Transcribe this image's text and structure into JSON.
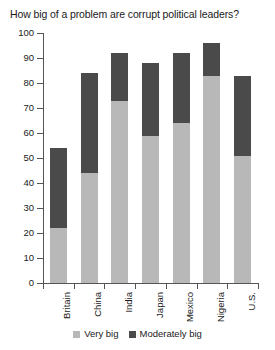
{
  "chart_data": {
    "type": "bar",
    "subtype": "stacked-bar",
    "title": "How big of a problem are corrupt political leaders?",
    "xlabel": "",
    "ylabel": "",
    "ylim": [
      0,
      100
    ],
    "ytick_step": 10,
    "yticks": [
      100,
      90,
      80,
      70,
      60,
      50,
      40,
      30,
      20,
      10,
      0
    ],
    "grid": false,
    "legend_position": "bottom-center",
    "categories": [
      "Britain",
      "China",
      "India",
      "Japan",
      "Mexico",
      "Nigeria",
      "U.S."
    ],
    "series": [
      {
        "name": "Very big",
        "color": "#b8b8b8",
        "values": [
          22,
          44,
          73,
          59,
          64,
          83,
          51
        ]
      },
      {
        "name": "Moderately big",
        "color": "#4a4a4a",
        "values": [
          32,
          40,
          19,
          29,
          28,
          13,
          32
        ]
      }
    ],
    "totals": [
      54,
      84,
      92,
      88,
      92,
      96,
      83
    ]
  },
  "legend": {
    "items": [
      {
        "label": "Very big",
        "color": "#b8b8b8"
      },
      {
        "label": "Moderately big",
        "color": "#4a4a4a"
      }
    ]
  },
  "colors": {
    "very_big": "#b8b8b8",
    "moderately_big": "#4a4a4a",
    "axis": "#555555",
    "text": "#1a1a1a",
    "background": "#ffffff"
  }
}
